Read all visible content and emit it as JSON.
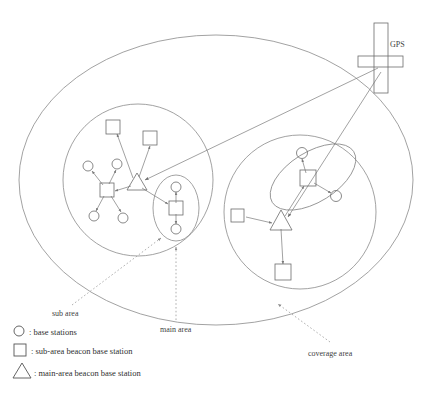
{
  "figure": {
    "type": "diagram"
  },
  "labels": {
    "gps": "GPS",
    "sub_area": "sub area",
    "main_area": "main area",
    "coverage_area": "coverage area"
  },
  "legend": {
    "items": [
      {
        "symbol": "circle",
        "text": ": base stations"
      },
      {
        "symbol": "square",
        "text": ": sub-area beacon base station"
      },
      {
        "symbol": "triangle",
        "text": ": main-area beacon base station"
      }
    ]
  },
  "regions": [
    {
      "name": "coverage-area-ellipse",
      "role": "coverage area"
    },
    {
      "name": "left-main-area-circle",
      "role": "main area"
    },
    {
      "name": "right-main-area-circle",
      "role": "main area"
    },
    {
      "name": "left-sub-area-ellipse",
      "role": "sub area"
    },
    {
      "name": "right-sub-area-ellipse",
      "role": "sub area"
    }
  ],
  "nodes": {
    "gps_antenna": {
      "type": "gps",
      "x": 382,
      "y": 62
    },
    "left_cluster": {
      "main_beacon_triangle": {
        "type": "triangle",
        "x": 137,
        "y": 183
      },
      "squares": [
        {
          "type": "square",
          "x": 113,
          "y": 127
        },
        {
          "type": "square",
          "x": 150,
          "y": 138
        },
        {
          "type": "square",
          "x": 107,
          "y": 190
        },
        {
          "type": "square",
          "x": 176,
          "y": 208
        }
      ],
      "circles": [
        {
          "type": "circle",
          "x": 88,
          "y": 166
        },
        {
          "type": "circle",
          "x": 117,
          "y": 164
        },
        {
          "type": "circle",
          "x": 94,
          "y": 216
        },
        {
          "type": "circle",
          "x": 123,
          "y": 218
        },
        {
          "type": "circle",
          "x": 175,
          "y": 187
        },
        {
          "type": "circle",
          "x": 176,
          "y": 229
        }
      ]
    },
    "right_cluster": {
      "main_beacon_triangle": {
        "type": "triangle",
        "x": 281,
        "y": 222
      },
      "squares": [
        {
          "type": "square",
          "x": 238,
          "y": 215
        },
        {
          "type": "square",
          "x": 308,
          "y": 178
        },
        {
          "type": "square",
          "x": 283,
          "y": 272
        }
      ],
      "circles": [
        {
          "type": "circle",
          "x": 302,
          "y": 153
        },
        {
          "type": "circle",
          "x": 336,
          "y": 196
        }
      ]
    }
  }
}
